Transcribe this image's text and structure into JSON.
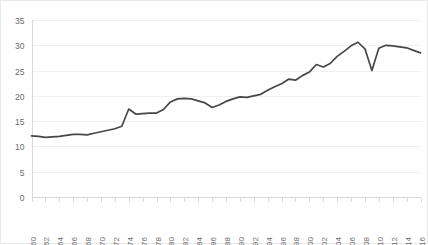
{
  "chart_data": {
    "type": "line",
    "title": "",
    "subtitle": "",
    "xlabel": "",
    "ylabel": "",
    "grid": true,
    "legend": false,
    "legend_position": "none",
    "line_color": "#474747",
    "gridline_color": "#f0f0f0",
    "axis_color": "#d9d9d9",
    "tick_label_color": "#6b6b6b",
    "xlim": [
      1960,
      2016
    ],
    "ylim": [
      0,
      35
    ],
    "y_ticks": [
      0,
      5,
      10,
      15,
      20,
      25,
      30,
      35
    ],
    "y_tick_labels": [
      "0",
      "5",
      "10",
      "15",
      "20",
      "25",
      "30",
      "35"
    ],
    "x_tick_labels": [
      "1960",
      "1962",
      "1964",
      "1966",
      "1968",
      "1970",
      "1972",
      "1974",
      "1976",
      "1978",
      "1980",
      "1982",
      "1984",
      "1986",
      "1988",
      "1990",
      "1992",
      "1994",
      "1996",
      "1998",
      "2000",
      "2002",
      "2004",
      "2006",
      "2008",
      "2010",
      "2012",
      "2014",
      "2016"
    ],
    "x_tick_rotation": -90,
    "x": [
      1960,
      1961,
      1962,
      1963,
      1964,
      1965,
      1966,
      1967,
      1968,
      1969,
      1970,
      1971,
      1972,
      1973,
      1974,
      1975,
      1976,
      1977,
      1978,
      1979,
      1980,
      1981,
      1982,
      1983,
      1984,
      1985,
      1986,
      1987,
      1988,
      1989,
      1990,
      1991,
      1992,
      1993,
      1994,
      1995,
      1996,
      1997,
      1998,
      1999,
      2000,
      2001,
      2002,
      2003,
      2004,
      2005,
      2006,
      2007,
      2008,
      2009,
      2010,
      2011,
      2012,
      2013,
      2014,
      2015,
      2016
    ],
    "values": [
      12.1,
      12.0,
      11.8,
      11.9,
      12.0,
      12.2,
      12.4,
      12.4,
      12.3,
      12.6,
      12.9,
      13.2,
      13.5,
      14.0,
      17.4,
      16.4,
      16.5,
      16.6,
      16.6,
      17.3,
      18.8,
      19.4,
      19.5,
      19.4,
      19.0,
      18.6,
      17.7,
      18.2,
      18.9,
      19.4,
      19.8,
      19.7,
      20.0,
      20.3,
      21.1,
      21.8,
      22.4,
      23.3,
      23.1,
      24.0,
      24.7,
      26.2,
      25.7,
      26.4,
      27.8,
      28.8,
      29.9,
      30.6,
      29.3,
      25.0,
      29.4,
      30.0,
      29.9,
      29.7,
      29.5,
      29.0,
      28.5
    ],
    "series": [
      {
        "name": "series-1",
        "values": [
          12.1,
          12.0,
          11.8,
          11.9,
          12.0,
          12.2,
          12.4,
          12.4,
          12.3,
          12.6,
          12.9,
          13.2,
          13.5,
          14.0,
          17.4,
          16.4,
          16.5,
          16.6,
          16.6,
          17.3,
          18.8,
          19.4,
          19.5,
          19.4,
          19.0,
          18.6,
          17.7,
          18.2,
          18.9,
          19.4,
          19.8,
          19.7,
          20.0,
          20.3,
          21.1,
          21.8,
          22.4,
          23.3,
          23.1,
          24.0,
          24.7,
          26.2,
          25.7,
          26.4,
          27.8,
          28.8,
          29.9,
          30.6,
          29.3,
          25.0,
          29.4,
          30.0,
          29.9,
          29.7,
          29.5,
          29.0,
          28.5
        ]
      }
    ]
  }
}
